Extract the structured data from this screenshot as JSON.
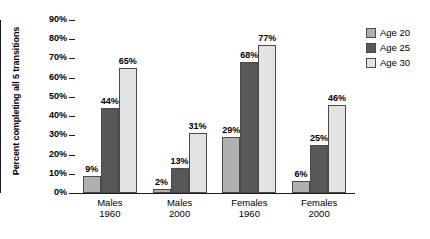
{
  "chart_data": {
    "type": "bar",
    "title": "",
    "subtitle": "",
    "xlabel": "",
    "ylabel": "Percent completing all 5 transitions",
    "ylim": [
      0,
      90
    ],
    "ytick_step": 10,
    "ytick_labels": [
      "0%",
      "10%",
      "20%",
      "30%",
      "40%",
      "50%",
      "60%",
      "70%",
      "80%",
      "90%"
    ],
    "ytick_values": [
      0,
      10,
      20,
      30,
      40,
      50,
      60,
      70,
      80,
      90
    ],
    "grid": false,
    "legend_position": "top-right",
    "categories": [
      "Males 1960",
      "Males 2000",
      "Females 1960",
      "Females 2000"
    ],
    "category_lines": [
      {
        "line1": "Males",
        "line2": "1960"
      },
      {
        "line1": "Males",
        "line2": "2000"
      },
      {
        "line1": "Females",
        "line2": "1960"
      },
      {
        "line1": "Females",
        "line2": "2000"
      }
    ],
    "series": [
      {
        "name": "Age 20",
        "color": "#b0b0b0",
        "values": [
          9,
          2,
          29,
          6
        ],
        "labels": [
          "9%",
          "2%",
          "29%",
          "6%"
        ]
      },
      {
        "name": "Age 25",
        "color": "#585858",
        "values": [
          44,
          13,
          68,
          25
        ],
        "labels": [
          "44%",
          "13%",
          "68%",
          "25%"
        ]
      },
      {
        "name": "Age 30",
        "color": "#e3e3e3",
        "values": [
          65,
          31,
          77,
          46
        ],
        "labels": [
          "65%",
          "31%",
          "77%",
          "46%"
        ]
      }
    ]
  },
  "legend": {
    "items": [
      {
        "label": "Age 20",
        "color": "#b0b0b0"
      },
      {
        "label": "Age 25",
        "color": "#585858"
      },
      {
        "label": "Age 30",
        "color": "#e3e3e3"
      }
    ]
  },
  "caption": ""
}
